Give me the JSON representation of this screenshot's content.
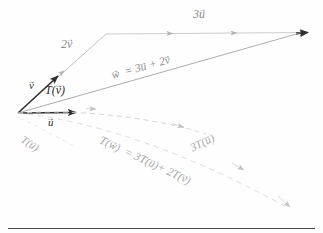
{
  "figure": {
    "background_color": "#fefefe",
    "labels": {
      "u": {
        "text": "u",
        "accent": "→",
        "style": "solid-dark"
      },
      "v": {
        "text": "v",
        "accent": "→",
        "style": "solid-dark"
      },
      "two_v": {
        "text": "2v",
        "accent": "→",
        "style": "faint"
      },
      "three_u": {
        "text": "3u",
        "accent": "→",
        "style": "faint"
      },
      "w_sum": {
        "text": "w = 3u + 2v",
        "accent": "→",
        "style": "faint"
      },
      "T_of_v": {
        "text": "T(v)",
        "accent": "→",
        "style": "solid-dark"
      },
      "T_of_u": {
        "text": "T(u)",
        "accent": "→",
        "style": "very-faint"
      },
      "three_T_of_u": {
        "text": "3T(u)",
        "accent": "→",
        "style": "very-faint"
      },
      "T_of_w_equation": {
        "text": "T(w) = 3T(u)+ 2T(v)",
        "accent": "→",
        "style": "very-faint"
      }
    },
    "colors": {
      "solid_vector": "#2e2e2e",
      "faint_vector": "#9a9a9a",
      "very_faint_vector": "#bdbdbd",
      "rule": "#4a4a4a"
    },
    "geometry": {
      "origin": [
        18,
        113
      ],
      "u_tip": [
        82,
        112
      ],
      "v_tip": [
        62,
        72
      ],
      "two_v_tip": [
        106,
        34
      ],
      "w_tip": [
        308,
        32
      ],
      "three_u_tip": [
        308,
        32
      ],
      "T_u_tip": [
        190,
        128
      ],
      "T_w_tip": [
        292,
        209
      ]
    }
  }
}
